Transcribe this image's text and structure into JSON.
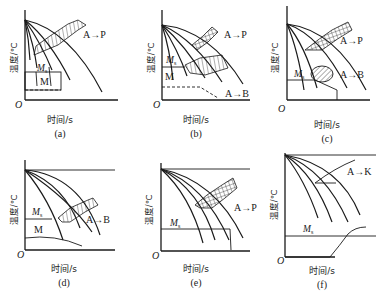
{
  "figure": {
    "panels": [
      {
        "id": "a",
        "caption": "(a)",
        "xlabel": "时间/s",
        "ylabel": "温度/℃",
        "origin": "O",
        "ms_label": "M",
        "ms_sub": "s",
        "region_labels": [
          "A→P",
          "M"
        ]
      },
      {
        "id": "b",
        "caption": "(b)",
        "xlabel": "时间/s",
        "ylabel": "温度/℃",
        "origin": "O",
        "ms_label": "M",
        "ms_sub": "s",
        "region_labels": [
          "A→P",
          "M",
          "A→B"
        ]
      },
      {
        "id": "c",
        "caption": "(c)",
        "xlabel": "时间/s",
        "ylabel": "温度/℃",
        "origin": "O",
        "ms_label": "M",
        "ms_sub": "s",
        "region_labels": [
          "A→P",
          "A→B"
        ]
      },
      {
        "id": "d",
        "caption": "(d)",
        "xlabel": "时间/s",
        "ylabel": "温度/℃",
        "origin": "O",
        "ms_label": "M",
        "ms_sub": "s",
        "region_labels": [
          "A→B",
          "M"
        ]
      },
      {
        "id": "e",
        "caption": "(e)",
        "xlabel": "时间/s",
        "ylabel": "温度/℃",
        "origin": "O",
        "ms_label": "M",
        "ms_sub": "s",
        "region_labels": [
          "A→P"
        ]
      },
      {
        "id": "f",
        "caption": "(f)",
        "xlabel": "时间/s",
        "ylabel": "温度/℃",
        "origin": "O",
        "ms_label": "M",
        "ms_sub": "s",
        "region_labels": [
          "A→K"
        ]
      }
    ]
  }
}
